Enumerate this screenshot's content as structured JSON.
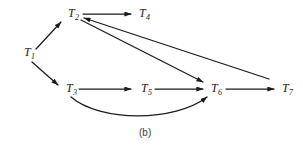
{
  "figure": {
    "caption": "(b)",
    "type": "directed-graph",
    "background_color": "#ffffff",
    "line_color": "#1a1a1a",
    "text_color": "#1a1a1a"
  },
  "nodes": [
    {
      "id": "T1",
      "base": "T",
      "sub": "1",
      "x": 24,
      "y": 56
    },
    {
      "id": "T2",
      "base": "T",
      "sub": "2",
      "x": 68,
      "y": 17
    },
    {
      "id": "T3",
      "base": "T",
      "sub": "3",
      "x": 66,
      "y": 92
    },
    {
      "id": "T4",
      "base": "T",
      "sub": "4",
      "x": 139,
      "y": 17
    },
    {
      "id": "T5",
      "base": "T",
      "sub": "5",
      "x": 141,
      "y": 92
    },
    {
      "id": "T6",
      "base": "T",
      "sub": "6",
      "x": 211,
      "y": 92
    },
    {
      "id": "T7",
      "base": "T",
      "sub": "7",
      "x": 282,
      "y": 92
    }
  ],
  "edges": [
    {
      "id": "e-t1-t2",
      "from": "T1",
      "to": "T2",
      "shape": "straight",
      "path": "M 36,49 L 61,22"
    },
    {
      "id": "e-t1-t3",
      "from": "T1",
      "to": "T3",
      "shape": "straight",
      "path": "M 32,62 L 58,85"
    },
    {
      "id": "e-t2-t4",
      "from": "T2",
      "to": "T4",
      "shape": "straight",
      "path": "M 83,14 L 131,14"
    },
    {
      "id": "e-t2-t6",
      "from": "T2",
      "to": "T6",
      "shape": "straight",
      "path": "M 81,20 L 203,82"
    },
    {
      "id": "e-t7-t2",
      "from": "T7",
      "to": "T2",
      "shape": "straight",
      "path": "M 269,79 L 84,18"
    },
    {
      "id": "e-t3-t5",
      "from": "T3",
      "to": "T5",
      "shape": "straight",
      "path": "M 79,89 L 131,89"
    },
    {
      "id": "e-t5-t6",
      "from": "T5",
      "to": "T6",
      "shape": "straight",
      "path": "M 155,89 L 203,89"
    },
    {
      "id": "e-t6-t7",
      "from": "T6",
      "to": "T7",
      "shape": "straight",
      "path": "M 226,89 L 274,89"
    },
    {
      "id": "e-t3-t6",
      "from": "T3",
      "to": "T6",
      "shape": "curved-arc",
      "path": "M 71,97 C 100,122 175,122 207,97"
    }
  ],
  "arrowhead": {
    "name": "solid-triangle-arrowhead",
    "width": 7,
    "height": 5
  }
}
